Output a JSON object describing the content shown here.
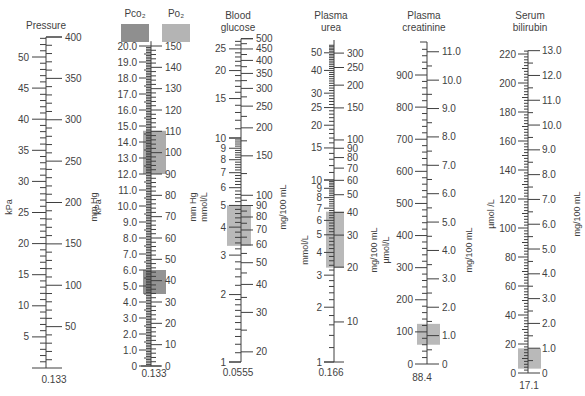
{
  "chart_data": {
    "type": "nomogram",
    "scales": [
      {
        "id": "pressure",
        "title": [
          "Pressure"
        ],
        "left_unit": "kPa",
        "right_unit": "mm Hg",
        "factor": "0.133",
        "scale_type": "linear",
        "axis_x": 46,
        "left_ticks": [
          5,
          10,
          15,
          20,
          25,
          30,
          35,
          40,
          45,
          50
        ],
        "right_ticks": [
          50,
          100,
          150,
          200,
          250,
          300,
          350,
          400
        ],
        "left_range": [
          0,
          53.2
        ],
        "right_range": [
          0,
          400
        ],
        "shaded": []
      },
      {
        "id": "blood-gases",
        "title": [
          "Pco2",
          "Po2"
        ],
        "legend": [
          {
            "label": "Pco₂",
            "color": "#8f8f8f"
          },
          {
            "label": "Po₂",
            "color": "#b4b4b4"
          }
        ],
        "left_unit": "kPa",
        "right_unit": "mm Hg",
        "factor": "0.133",
        "scale_type": "linear",
        "axis_x": 151,
        "left_ticks": [
          "0",
          "1.0",
          "2.0",
          "3.0",
          "4.0",
          "5.0",
          "6.0",
          "7.0",
          "8.0",
          "9.0",
          "10.0",
          "11.0",
          "12.0",
          "13.0",
          "14.0",
          "15.0",
          "16.0",
          "17.0",
          "18.0",
          "19.0",
          "20.0"
        ],
        "right_ticks": [
          0,
          10,
          20,
          30,
          40,
          50,
          60,
          70,
          80,
          90,
          100,
          110,
          120,
          130,
          140,
          150
        ],
        "left_range": [
          0,
          20
        ],
        "right_range": [
          0,
          150
        ],
        "shaded": [
          {
            "label": "Po2 normal range",
            "from_kPa": 12.0,
            "to_kPa": 14.7,
            "color": "#9e9e9e"
          },
          {
            "label": "Pco2 normal range",
            "from_kPa": 4.5,
            "to_kPa": 6.0,
            "color": "#808080"
          }
        ]
      },
      {
        "id": "blood-glucose",
        "title": [
          "Blood",
          "glucose"
        ],
        "left_unit": "mmol/L",
        "right_unit": "mg/100 mL",
        "factor": "0.0555",
        "scale_type": "log",
        "axis_x": 241,
        "left_ticks": [
          1,
          2,
          3,
          4,
          5,
          6,
          7,
          8,
          9,
          10,
          15,
          20,
          25
        ],
        "right_ticks": [
          20,
          30,
          40,
          50,
          60,
          70,
          80,
          90,
          100,
          150,
          200,
          250,
          300,
          350,
          400,
          450,
          500
        ],
        "left_range": [
          1,
          27.75
        ],
        "right_range": [
          18,
          500
        ],
        "shaded": [
          {
            "label": "normal range",
            "from_mmol": 3.3,
            "to_mmol": 5.0,
            "color": "#a8a8a8"
          }
        ]
      },
      {
        "id": "plasma-urea",
        "title": [
          "Plasma",
          "urea"
        ],
        "left_unit": "mmol/L",
        "right_unit": "mg/100 mL",
        "factor": "0.166",
        "scale_type": "log",
        "axis_x": 334,
        "left_ticks": [
          1,
          2,
          3,
          4,
          5,
          6,
          7,
          8,
          9,
          10,
          15,
          20,
          25,
          30,
          40,
          50
        ],
        "right_ticks": [
          10,
          20,
          30,
          40,
          50,
          60,
          70,
          80,
          90,
          100,
          150,
          200,
          250,
          300
        ],
        "left_range": [
          1,
          55
        ],
        "right_range": [
          6,
          330
        ],
        "shaded": [
          {
            "label": "normal range",
            "from_mmol": 3.3,
            "to_mmol": 6.7,
            "color": "#a8a8a8"
          }
        ]
      },
      {
        "id": "plasma-creatinine",
        "title": [
          "Plasma",
          "creatinine"
        ],
        "left_unit": "µmol/L",
        "right_unit": "mg/100 mL",
        "factor": "88.4",
        "scale_type": "linear",
        "axis_x": 427,
        "left_ticks": [
          0,
          100,
          200,
          300,
          400,
          500,
          600,
          700,
          800,
          900
        ],
        "right_ticks": [
          "0",
          "1.0",
          "2.0",
          "3.0",
          "4.0",
          "5.0",
          "6.0",
          "7.0",
          "8.0",
          "9.0",
          "10.0",
          "11.0"
        ],
        "left_range": [
          0,
          1000
        ],
        "right_range": [
          0,
          11.3
        ],
        "shaded": [
          {
            "label": "normal range",
            "from_umol": 60,
            "to_umol": 125,
            "color": "#a8a8a8"
          }
        ]
      },
      {
        "id": "serum-bilirubin",
        "title": [
          "Serum",
          "bilirubin"
        ],
        "left_unit": "µmol /L",
        "right_unit": "mg/100 mL",
        "factor": "17.1",
        "scale_type": "linear",
        "axis_x": 528,
        "left_ticks": [
          0,
          20,
          40,
          60,
          80,
          100,
          120,
          140,
          160,
          180,
          200,
          220
        ],
        "right_ticks": [
          "0",
          "1.0",
          "2.0",
          "3.0",
          "4.0",
          "5.0",
          "6.0",
          "7.0",
          "8.0",
          "9.0",
          "10.0",
          "11.0",
          "12.0",
          "13.0"
        ],
        "left_range": [
          0,
          222
        ],
        "right_range": [
          0,
          13.0
        ],
        "shaded": [
          {
            "label": "normal range",
            "from_umol": 3,
            "to_umol": 17,
            "color": "#a8a8a8"
          }
        ]
      }
    ]
  }
}
